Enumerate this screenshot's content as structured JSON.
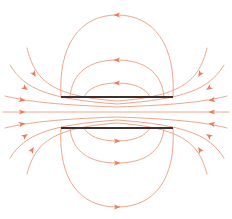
{
  "diagram": {
    "title": "",
    "width": 232,
    "height": 219,
    "colors": {
      "field_line": "#f0a68c",
      "arrow": "#ec7a5c",
      "plate": "#3a3030",
      "background": "#ffffff"
    },
    "plates": [
      {
        "name": "top-plate",
        "x1": 61,
        "y1": 97,
        "x2": 173,
        "y2": 97
      },
      {
        "name": "bottom-plate",
        "x1": 61,
        "y1": 128,
        "x2": 173,
        "y2": 128
      }
    ],
    "field_lines": [
      {
        "name": "outer-top-loop",
        "d": "M61,97 C58,45 80,15 117,15 C154,15 176,45 173,97"
      },
      {
        "name": "middle-top-loop",
        "d": "M70,97 C72,72 90,60 117,60 C144,60 162,72 164,97"
      },
      {
        "name": "inner-top-loop",
        "d": "M84,97 C88,88 100,83 117,83 C134,83 146,88 150,97"
      },
      {
        "name": "outer-bottom-loop",
        "d": "M61,128 C58,180 80,207 117,207 C154,207 176,180 173,128"
      },
      {
        "name": "middle-bottom-loop",
        "d": "M70,128 C72,152 90,163 117,163 C144,163 162,152 164,128"
      },
      {
        "name": "inner-bottom-loop",
        "d": "M84,128 C88,136 100,141 117,141 C134,141 146,136 150,128"
      },
      {
        "name": "left-fringe-1",
        "d": "M27,48 C35,80 50,96 117,101 C184,96 199,80 207,48"
      },
      {
        "name": "left-fringe-2",
        "d": "M10,65 C25,90 50,99 117,104 C184,99 209,90 224,65"
      },
      {
        "name": "left-fringe-3",
        "d": "M5,96 C30,102 60,105 117,107 C174,105 204,102 227,96"
      },
      {
        "name": "center-line",
        "d": "M3,112 L229,112"
      },
      {
        "name": "left-fringe-4",
        "d": "M5,128 C30,122 60,119 117,117 C174,119 204,122 227,128"
      },
      {
        "name": "left-fringe-5",
        "d": "M10,158 C25,134 50,125 117,120 C184,125 209,134 224,158"
      },
      {
        "name": "left-fringe-6",
        "d": "M27,174 C35,144 50,128 117,123 C184,128 199,144 207,174"
      }
    ],
    "arrows": [
      {
        "name": "arrow-outer-top",
        "x": 117,
        "y": 15,
        "angle": 180
      },
      {
        "name": "arrow-middle-top",
        "x": 117,
        "y": 60,
        "angle": 180
      },
      {
        "name": "arrow-inner-top",
        "x": 117,
        "y": 83,
        "angle": 180
      },
      {
        "name": "arrow-outer-bottom",
        "x": 117,
        "y": 207,
        "angle": 0
      },
      {
        "name": "arrow-middle-bottom",
        "x": 117,
        "y": 163,
        "angle": 0
      },
      {
        "name": "arrow-inner-bottom",
        "x": 117,
        "y": 141,
        "angle": 0
      },
      {
        "name": "arrow-left-1",
        "x": 34,
        "y": 74,
        "angle": 60
      },
      {
        "name": "arrow-left-2",
        "x": 25,
        "y": 88,
        "angle": 35
      },
      {
        "name": "arrow-left-3",
        "x": 22,
        "y": 100,
        "angle": 12
      },
      {
        "name": "arrow-left-4",
        "x": 22,
        "y": 112,
        "angle": 0
      },
      {
        "name": "arrow-left-5",
        "x": 22,
        "y": 124,
        "angle": -12
      },
      {
        "name": "arrow-left-6",
        "x": 25,
        "y": 136,
        "angle": -35
      },
      {
        "name": "arrow-left-7",
        "x": 32,
        "y": 150,
        "angle": -60
      },
      {
        "name": "arrow-right-1",
        "x": 200,
        "y": 74,
        "angle": 120
      },
      {
        "name": "arrow-right-2",
        "x": 209,
        "y": 88,
        "angle": 145
      },
      {
        "name": "arrow-right-3",
        "x": 212,
        "y": 100,
        "angle": 168
      },
      {
        "name": "arrow-right-4",
        "x": 212,
        "y": 112,
        "angle": 180
      },
      {
        "name": "arrow-right-5",
        "x": 212,
        "y": 124,
        "angle": 192
      },
      {
        "name": "arrow-right-6",
        "x": 209,
        "y": 136,
        "angle": 215
      },
      {
        "name": "arrow-right-7",
        "x": 200,
        "y": 150,
        "angle": 240
      }
    ]
  }
}
